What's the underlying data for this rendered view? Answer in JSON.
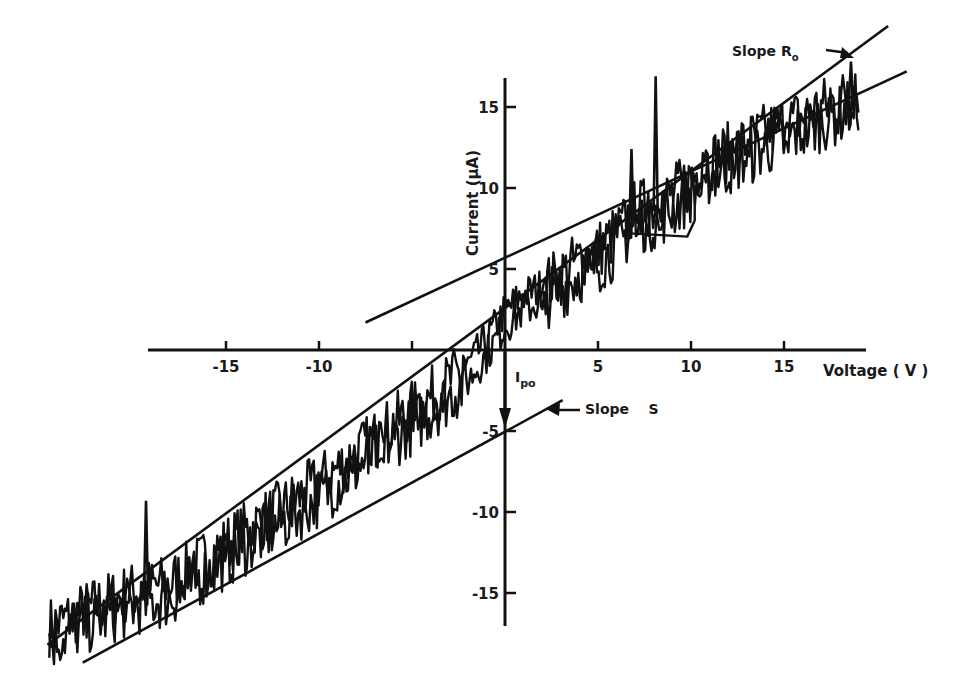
{
  "chart_data": {
    "type": "line",
    "title": "",
    "xlabel": "Voltage (V)",
    "ylabel": "Current (μA)",
    "xlim": [
      -24.6,
      21.6
    ],
    "ylim": [
      -17,
      17
    ],
    "grid": false,
    "x_ticks": [
      -15,
      -10,
      -5,
      5,
      10,
      15
    ],
    "x_tick_labels": [
      "-15",
      "-10",
      "",
      "5",
      "10",
      "15"
    ],
    "y_ticks": [
      -15,
      -10,
      -5,
      5,
      10,
      15
    ],
    "y_tick_labels": [
      "-15",
      "-10",
      "-5",
      "5",
      "10",
      "15"
    ],
    "series": [
      {
        "name": "Measured I-V trace (noisy)",
        "style": "noisy",
        "x": [
          -24.5,
          -22,
          -20,
          -18,
          -16,
          -14,
          -12,
          -10,
          -8,
          -6,
          -4,
          -2,
          -1,
          0,
          1,
          2,
          3,
          4,
          5,
          6,
          6.5,
          7,
          8,
          9,
          10,
          11,
          12,
          13,
          14,
          15,
          16,
          17,
          18,
          19
        ],
        "y": [
          -17.5,
          -16.2,
          -15.3,
          -14.8,
          -13.2,
          -11.6,
          -10.2,
          -8.6,
          -6.8,
          -5.0,
          -3.3,
          -1.4,
          0.2,
          2.0,
          3.0,
          3.5,
          4.2,
          5.2,
          5.8,
          6.8,
          7.5,
          8.3,
          8.5,
          9.2,
          10.2,
          11.3,
          11.8,
          12.4,
          13.0,
          13.5,
          14.0,
          14.6,
          15.0,
          15.8
        ],
        "spikes": [
          {
            "x": -19.3,
            "y": -9.3
          },
          {
            "x": 6.8,
            "y": 12.4
          },
          {
            "x": 8.1,
            "y": 16.9
          },
          {
            "x": 18.6,
            "y": 17.8
          }
        ]
      },
      {
        "name": "Linear fit (Slope R0)",
        "style": "line",
        "x": [
          -24.6,
          20.6
        ],
        "y": [
          -18.2,
          20.0
        ]
      },
      {
        "name": "Tangent line (upper)",
        "style": "line",
        "x": [
          -7.5,
          21.6
        ],
        "y": [
          1.7,
          17.2
        ]
      },
      {
        "name": "Tangent line (Slope S)",
        "style": "line",
        "x": [
          -22.7,
          3.1
        ],
        "y": [
          -19.3,
          -3.1
        ]
      }
    ],
    "annotations": [
      {
        "text": "Slope R₀",
        "x": 14.8,
        "y": 19.5,
        "arrow_to": [
          18.6,
          17.8
        ]
      },
      {
        "text": "Slope S",
        "x": 6.2,
        "y": -3.7,
        "arrow_to": [
          2.3,
          -3.6
        ]
      },
      {
        "text": "I_po",
        "x": 0.5,
        "y": -1.7,
        "arrow_from": [
          0,
          0
        ],
        "arrow_to": [
          0,
          -4.8
        ]
      }
    ]
  },
  "labels": {
    "x_axis_title": "Voltage  ( V )",
    "y_axis_title": "Current  (μA)",
    "slope_r0": "Slope  R",
    "slope_r0_sub": "o",
    "slope_s": "Slope    S",
    "ipo_main": "I",
    "ipo_sub": "po"
  }
}
